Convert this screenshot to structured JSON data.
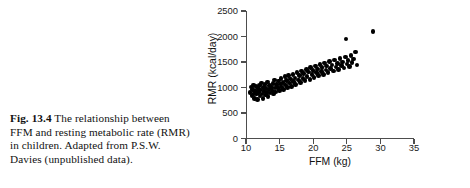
{
  "caption": {
    "figure_number": "Fig. 13.4",
    "text": "The relationship between FFM and resting metabolic rate (RMR) in children. Adapted from P.S.W. Davies (unpublished data)."
  },
  "chart_data": {
    "type": "scatter",
    "title": "",
    "xlabel": "FFM (kg)",
    "ylabel": "RMR (kcal/day)",
    "xlim": [
      10,
      35
    ],
    "ylim": [
      0,
      2500
    ],
    "xticks": [
      "10",
      "15",
      "20",
      "25",
      "30",
      "35"
    ],
    "yticks": [
      "0",
      "500",
      "1000",
      "1500",
      "2000",
      "2500"
    ],
    "xtick_values": [
      10,
      15,
      20,
      25,
      30,
      35
    ],
    "ytick_values": [
      0,
      500,
      1000,
      1500,
      2000,
      2500
    ],
    "grid": false,
    "legend": null,
    "marker": "filled-circle",
    "marker_color": "#000000",
    "axis_color": "#4d4d4d",
    "points": [
      [
        10.6,
        900
      ],
      [
        10.8,
        1010
      ],
      [
        10.9,
        840
      ],
      [
        11.0,
        960
      ],
      [
        11.1,
        1050
      ],
      [
        11.2,
        880
      ],
      [
        11.3,
        790
      ],
      [
        11.4,
        930
      ],
      [
        11.5,
        1020
      ],
      [
        11.6,
        870
      ],
      [
        11.7,
        760
      ],
      [
        11.8,
        980
      ],
      [
        11.9,
        900
      ],
      [
        12.0,
        1040
      ],
      [
        12.1,
        830
      ],
      [
        12.2,
        950
      ],
      [
        12.3,
        1090
      ],
      [
        12.4,
        870
      ],
      [
        12.5,
        790
      ],
      [
        12.6,
        1000
      ],
      [
        12.7,
        920
      ],
      [
        12.8,
        1060
      ],
      [
        12.9,
        850
      ],
      [
        13.0,
        980
      ],
      [
        13.1,
        900
      ],
      [
        13.2,
        1110
      ],
      [
        13.3,
        820
      ],
      [
        13.4,
        960
      ],
      [
        13.5,
        1040
      ],
      [
        13.6,
        890
      ],
      [
        13.8,
        1000
      ],
      [
        13.9,
        930
      ],
      [
        14.0,
        1080
      ],
      [
        14.1,
        870
      ],
      [
        14.2,
        1150
      ],
      [
        14.3,
        990
      ],
      [
        14.4,
        910
      ],
      [
        14.5,
        1060
      ],
      [
        14.7,
        1000
      ],
      [
        14.8,
        1130
      ],
      [
        15.0,
        940
      ],
      [
        15.1,
        1070
      ],
      [
        15.2,
        1180
      ],
      [
        15.3,
        1010
      ],
      [
        15.5,
        1100
      ],
      [
        15.6,
        960
      ],
      [
        15.8,
        1210
      ],
      [
        15.9,
        1050
      ],
      [
        16.0,
        1140
      ],
      [
        16.2,
        1000
      ],
      [
        16.3,
        1230
      ],
      [
        16.5,
        1090
      ],
      [
        16.6,
        1170
      ],
      [
        16.8,
        1020
      ],
      [
        17.0,
        1250
      ],
      [
        17.1,
        1120
      ],
      [
        17.3,
        1190
      ],
      [
        17.4,
        1060
      ],
      [
        17.6,
        1290
      ],
      [
        17.8,
        1150
      ],
      [
        18.0,
        1230
      ],
      [
        18.1,
        1100
      ],
      [
        18.3,
        1320
      ],
      [
        18.5,
        1180
      ],
      [
        18.6,
        1270
      ],
      [
        18.8,
        1140
      ],
      [
        19.0,
        1350
      ],
      [
        19.1,
        1220
      ],
      [
        19.3,
        1300
      ],
      [
        19.5,
        1160
      ],
      [
        19.6,
        1390
      ],
      [
        19.8,
        1250
      ],
      [
        20.0,
        1330
      ],
      [
        20.1,
        1200
      ],
      [
        20.3,
        1420
      ],
      [
        20.5,
        1290
      ],
      [
        20.6,
        1360
      ],
      [
        20.8,
        1230
      ],
      [
        21.0,
        1450
      ],
      [
        21.2,
        1310
      ],
      [
        21.3,
        1390
      ],
      [
        21.5,
        1260
      ],
      [
        21.7,
        1480
      ],
      [
        21.9,
        1340
      ],
      [
        22.0,
        1420
      ],
      [
        22.2,
        1290
      ],
      [
        22.4,
        1510
      ],
      [
        22.6,
        1370
      ],
      [
        22.8,
        1440
      ],
      [
        23.0,
        1320
      ],
      [
        23.2,
        1540
      ],
      [
        23.4,
        1400
      ],
      [
        23.6,
        1470
      ],
      [
        23.8,
        1350
      ],
      [
        24.0,
        1570
      ],
      [
        24.2,
        1430
      ],
      [
        24.4,
        1500
      ],
      [
        24.6,
        1380
      ],
      [
        24.8,
        1600
      ],
      [
        25.0,
        1460
      ],
      [
        25.2,
        1530
      ],
      [
        25.4,
        1410
      ],
      [
        25.6,
        1630
      ],
      [
        25.8,
        1490
      ],
      [
        26.0,
        1560
      ],
      [
        26.3,
        1700
      ],
      [
        26.5,
        1440
      ],
      [
        24.9,
        1950
      ],
      [
        28.9,
        2100
      ]
    ]
  }
}
